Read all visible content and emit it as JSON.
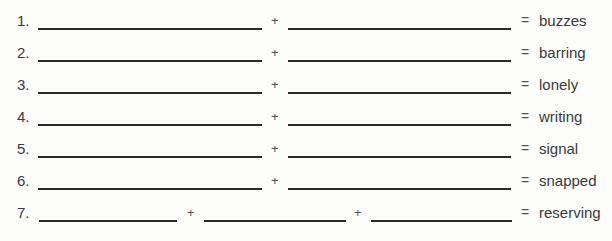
{
  "exercise": {
    "plus_symbol": "+",
    "equals_symbol": "=",
    "rows": [
      {
        "number": "1.",
        "parts": 2,
        "answer": "buzzes"
      },
      {
        "number": "2.",
        "parts": 2,
        "answer": "barring"
      },
      {
        "number": "3.",
        "parts": 2,
        "answer": "lonely"
      },
      {
        "number": "4.",
        "parts": 2,
        "answer": "writing"
      },
      {
        "number": "5.",
        "parts": 2,
        "answer": "signal"
      },
      {
        "number": "6.",
        "parts": 2,
        "answer": "snapped"
      },
      {
        "number": "7.",
        "parts": 3,
        "answer": "reserving"
      }
    ]
  }
}
